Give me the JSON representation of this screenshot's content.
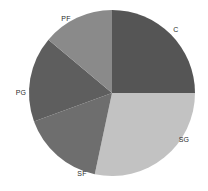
{
  "chart_data": {
    "type": "pie",
    "title": "",
    "subtitle": "",
    "xlabel": "",
    "ylabel": "",
    "grid": false,
    "legend_position": "none",
    "label_placement": "outside",
    "start_angle_deg": 0,
    "direction": "clockwise",
    "categories": [
      "C",
      "SG",
      "SF",
      "PG",
      "PF"
    ],
    "values": [
      25,
      28,
      16,
      17,
      14
    ],
    "slices": [
      {
        "label": "C",
        "value": 25,
        "start_deg": 0,
        "end_deg": 90,
        "color": "#555555",
        "label_x": 176,
        "label_y": 29
      },
      {
        "label": "SG",
        "value": 28,
        "start_deg": 90,
        "end_deg": 192,
        "color": "#c2c2c2",
        "label_x": 184,
        "label_y": 139
      },
      {
        "label": "SF",
        "value": 16,
        "start_deg": 192,
        "end_deg": 250,
        "color": "#6e6e6e",
        "label_x": 82,
        "label_y": 173
      },
      {
        "label": "PG",
        "value": 17,
        "start_deg": 250,
        "end_deg": 310,
        "color": "#5e5e5e",
        "label_x": 21,
        "label_y": 92
      },
      {
        "label": "PF",
        "value": 14,
        "start_deg": 310,
        "end_deg": 360,
        "color": "#8a8a8a",
        "label_x": 66,
        "label_y": 18
      }
    ],
    "geometry": {
      "center_x": 112,
      "center_y": 93,
      "radius": 83
    },
    "background_color": "#ffffff",
    "text_color": "#2b2b2b"
  }
}
